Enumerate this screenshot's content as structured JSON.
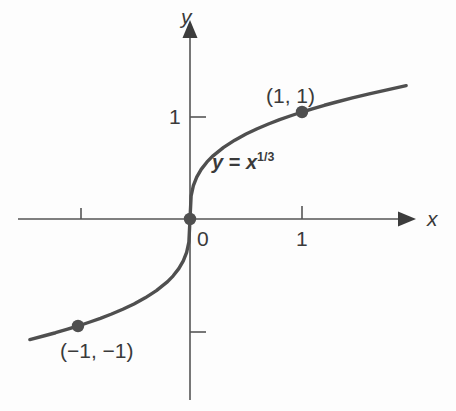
{
  "figure": {
    "kind": "cartesian-graph",
    "background_color": "#fdfdfd",
    "ink_color": "#4a4a4a",
    "text_color": "#3a3a3a"
  },
  "axes": {
    "x_axis_name": "x",
    "y_axis_name": "y",
    "origin_label": "0",
    "x_ticks": [
      {
        "value": -1,
        "label": ""
      },
      {
        "value": 1,
        "label": "1"
      }
    ],
    "y_ticks": [
      {
        "value": 1,
        "label": "1"
      },
      {
        "value": -1,
        "label": ""
      }
    ],
    "x_arrow": "right-arrowhead-icon",
    "y_arrow": "up-arrowhead-icon"
  },
  "annotations": {
    "equation": {
      "lhs": "y",
      "operator": "=",
      "base": "x",
      "exponent": "1/3"
    },
    "point_upper_label": "(1, 1)",
    "point_lower_label": "(−1, −1)"
  },
  "chart_data": {
    "type": "line",
    "title": "",
    "subtitle": "",
    "xlabel": "x",
    "ylabel": "y",
    "legend": [],
    "grid": false,
    "xlim": [
      -1.43,
      1.93
    ],
    "ylim": [
      -1.93,
      2.07
    ],
    "series": [
      {
        "name": "y = x^(1/3)",
        "equation": "y = x^(1/3)",
        "color": "#4f4f4f",
        "x": [
          -1.43,
          -1.3,
          -1.2,
          -1.1,
          -1.0,
          -0.9,
          -0.8,
          -0.7,
          -0.6,
          -0.5,
          -0.4,
          -0.3,
          -0.2,
          -0.15,
          -0.1,
          -0.06,
          -0.03,
          -0.01,
          0.0,
          0.01,
          0.03,
          0.06,
          0.1,
          0.15,
          0.2,
          0.3,
          0.4,
          0.5,
          0.6,
          0.7,
          0.8,
          0.9,
          1.0,
          1.1,
          1.2,
          1.3,
          1.45,
          1.6,
          1.75,
          1.93
        ],
        "y": [
          -1.127,
          -1.091,
          -1.063,
          -1.032,
          -1.0,
          -0.965,
          -0.928,
          -0.888,
          -0.843,
          -0.794,
          -0.737,
          -0.669,
          -0.585,
          -0.531,
          -0.464,
          -0.391,
          -0.311,
          -0.215,
          0.0,
          0.215,
          0.311,
          0.391,
          0.464,
          0.531,
          0.585,
          0.669,
          0.737,
          0.794,
          0.843,
          0.888,
          0.928,
          0.965,
          1.0,
          1.032,
          1.063,
          1.091,
          1.132,
          1.17,
          1.205,
          1.246
        ]
      }
    ],
    "points": [
      {
        "label": "(1, 1)",
        "x": 1,
        "y": 1
      },
      {
        "label": "(−1, −1)",
        "x": -1,
        "y": -1
      },
      {
        "label": "",
        "x": 0,
        "y": 0
      }
    ]
  }
}
